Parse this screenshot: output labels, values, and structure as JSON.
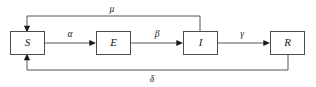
{
  "diagram": {
    "type": "flow-diagram",
    "colors": {
      "background": "#ffffff",
      "box_stroke": "#4d4d4d",
      "edge_stroke": "#555555",
      "text": "#1a1a1a"
    },
    "nodes": [
      {
        "id": "S",
        "label": "S",
        "name": "susceptible"
      },
      {
        "id": "E",
        "label": "E",
        "name": "exposed"
      },
      {
        "id": "I",
        "label": "I",
        "name": "infected"
      },
      {
        "id": "R",
        "label": "R",
        "name": "recovered"
      }
    ],
    "edges": [
      {
        "id": "alpha",
        "label": "α",
        "from": "S",
        "to": "E",
        "route": "horizontal"
      },
      {
        "id": "beta",
        "label": "β",
        "from": "E",
        "to": "I",
        "route": "horizontal"
      },
      {
        "id": "gamma",
        "label": "γ",
        "from": "I",
        "to": "R",
        "route": "horizontal"
      },
      {
        "id": "mu",
        "label": "μ",
        "from": "I",
        "to": "S",
        "route": "top-feedback"
      },
      {
        "id": "delta",
        "label": "δ",
        "from": "R",
        "to": "S",
        "route": "bottom-feedback"
      }
    ]
  }
}
